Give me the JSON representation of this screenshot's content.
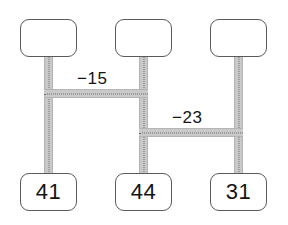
{
  "diagram": {
    "type": "three-column-connector-diagram",
    "background_color": "#ffffff",
    "node_border_color": "#5a5a5a",
    "connector_color": "#c9c9c9",
    "dotted_line_color": "#6f6f6f",
    "text_color": "#141414",
    "top_nodes": [
      {
        "id": "top-node-1",
        "label": ""
      },
      {
        "id": "top-node-2",
        "label": ""
      },
      {
        "id": "top-node-3",
        "label": ""
      }
    ],
    "bottom_nodes": [
      {
        "id": "bottom-node-1",
        "label": "41"
      },
      {
        "id": "bottom-node-2",
        "label": "44"
      },
      {
        "id": "bottom-node-3",
        "label": "31"
      }
    ],
    "edge_labels": [
      {
        "id": "edge-label-1",
        "label": "−15",
        "connects": "column-1-to-column-2"
      },
      {
        "id": "edge-label-2",
        "label": "−23",
        "connects": "column-2-to-column-3"
      }
    ]
  }
}
